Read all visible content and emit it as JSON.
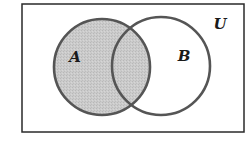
{
  "diagram": {
    "type": "venn",
    "universe": {
      "label": "U",
      "rect": {
        "x": 22,
        "y": 4,
        "width": 222,
        "height": 128
      },
      "stroke": "#2a2a2a",
      "label_pos": {
        "x": 220,
        "y": 29
      }
    },
    "sets": [
      {
        "label": "A",
        "cx": 102,
        "cy": 67,
        "r": 48,
        "shaded": true,
        "label_pos": {
          "x": 75,
          "y": 62
        }
      },
      {
        "label": "B",
        "cx": 161,
        "cy": 66,
        "r": 49,
        "shaded": false,
        "label_pos": {
          "x": 184,
          "y": 61
        }
      }
    ],
    "shaded_region": "A",
    "colors": {
      "shade": "#c9c9c9",
      "circle_stroke": "#555555",
      "background": "#ffffff"
    }
  }
}
